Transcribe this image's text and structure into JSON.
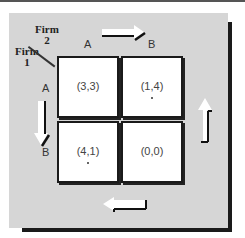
{
  "diagram": {
    "type": "payoff_matrix",
    "row_player": {
      "name_line1": "Firm",
      "name_line2": "1",
      "strategies": [
        "A",
        "B"
      ]
    },
    "col_player": {
      "name_line1": "Firm",
      "name_line2": "2",
      "strategies": [
        "A",
        "B"
      ]
    },
    "cells": [
      {
        "row": "A",
        "col": "A",
        "payoff": "(3,3)",
        "marked": false
      },
      {
        "row": "A",
        "col": "B",
        "payoff": "(1,4)",
        "marked": true
      },
      {
        "row": "B",
        "col": "A",
        "payoff": "(4,1)",
        "marked": true
      },
      {
        "row": "B",
        "col": "B",
        "payoff": "(0,0)",
        "marked": false
      }
    ],
    "arrows": [
      {
        "position": "top",
        "direction": "right"
      },
      {
        "position": "right",
        "direction": "up"
      },
      {
        "position": "bottom",
        "direction": "left"
      },
      {
        "position": "left",
        "direction": "down"
      }
    ],
    "colors": {
      "panel": "#d6d6d6",
      "cell": "#ffffff",
      "border": "#1a1a1a"
    }
  }
}
